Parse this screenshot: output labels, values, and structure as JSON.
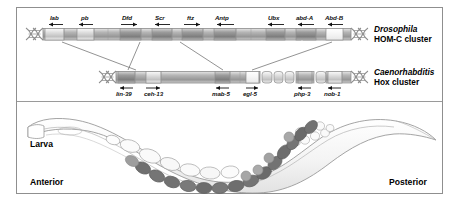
{
  "figure": {
    "title_present": false,
    "panels": [
      "hox-cluster-comparison",
      "larva-diagram"
    ]
  },
  "clusters": [
    {
      "id": "drosophila-hom-c",
      "taxon": "Drosophila",
      "subtitle": "HOM-C cluster",
      "label_position": "above",
      "genes": [
        {
          "name": "lab",
          "direction": "left",
          "x": 52,
          "label_x": 55,
          "seg_x": 45,
          "seg_w": 19,
          "fill": "#b8b8b8"
        },
        {
          "name": "pb",
          "direction": "left",
          "x": 84,
          "label_x": 86,
          "seg_x": 77,
          "seg_w": 17,
          "fill": "#b8b8b8"
        },
        {
          "name": "Dfd",
          "direction": "right",
          "x": 127,
          "label_x": 126,
          "seg_x": 120,
          "seg_w": 21,
          "fill": "#a2a2a2"
        },
        {
          "name": "Scr",
          "direction": "left",
          "x": 160,
          "label_x": 159,
          "seg_x": 152,
          "seg_w": 20,
          "fill": "#a6a6a6"
        },
        {
          "name": "ftz",
          "direction": "right",
          "x": 190,
          "label_x": 190,
          "seg_x": 182,
          "seg_w": 21,
          "fill": "#9d9d9d"
        },
        {
          "name": "Antp",
          "direction": "left",
          "x": 222,
          "label_x": 220,
          "seg_x": 214,
          "seg_w": 22,
          "fill": "#a8a8a8"
        },
        {
          "name": "Ubx",
          "direction": "left",
          "x": 274,
          "label_x": 273,
          "seg_x": 266,
          "seg_w": 19,
          "fill": "#a0a0a0"
        },
        {
          "name": "abd-A",
          "direction": "left",
          "x": 304,
          "label_x": 300,
          "seg_x": 296,
          "seg_w": 20,
          "fill": "#8e8e8e"
        },
        {
          "name": "Abd-B",
          "direction": "left",
          "x": 333,
          "label_x": 329,
          "seg_x": 326,
          "seg_w": 17,
          "fill": "#efefef"
        }
      ]
    },
    {
      "id": "caenorhabditis-hox",
      "taxon": "Caenorhabditis",
      "subtitle": "Hox cluster",
      "label_position": "below",
      "genes": [
        {
          "name": "lin-39",
          "direction": "left",
          "x": 124,
          "label_x": 115,
          "seg_x": 118,
          "seg_w": 17,
          "fill": "#a6a6a6"
        },
        {
          "name": "ceh-13",
          "direction": "right",
          "x": 153,
          "label_x": 144,
          "seg_x": 146,
          "seg_w": 15,
          "fill": "#b4b4b4"
        },
        {
          "name": "mab-5",
          "direction": "left",
          "x": 222,
          "label_x": 212,
          "seg_x": 215,
          "seg_w": 15,
          "fill": "#a3a3a3"
        },
        {
          "name": "egl-5",
          "direction": "right",
          "x": 252,
          "label_x": 244,
          "seg_x": 246,
          "seg_w": 13,
          "fill": "#d6d6d6"
        },
        {
          "name": "php-3",
          "direction": "left",
          "x": 305,
          "label_x": 295,
          "seg_x": 298,
          "seg_w": 14,
          "fill": "#b0b0b0"
        },
        {
          "name": "nob-1",
          "direction": "left",
          "x": 333,
          "label_x": 325,
          "seg_x": 326,
          "seg_w": 14,
          "fill": "#bdbdbd"
        }
      ]
    }
  ],
  "larva": {
    "label": "Larva",
    "anterior_label": "Anterior",
    "posterior_label": "Posterior"
  },
  "colors": {
    "frame_border": "#8f8f8f",
    "bar_outline": "#8a8a8a",
    "bar_base": "#cdcdcd",
    "connector_line": "#6f6f6f",
    "text": "#000000",
    "worm_outline": "#9a9a9a",
    "worm_fill": "#f2f2f2",
    "cell_dark": "#6e6e6e",
    "cell_mid": "#9e9e9e",
    "cell_light": "#f4f4f4"
  }
}
